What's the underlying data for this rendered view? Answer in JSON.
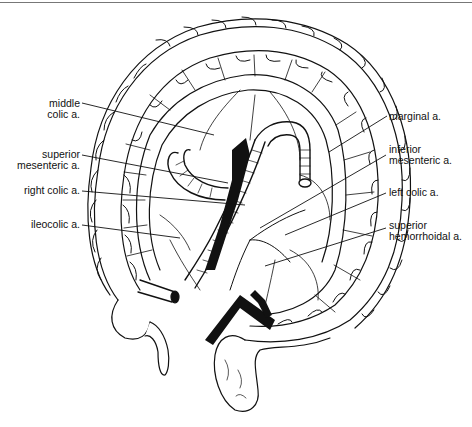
{
  "figure": {
    "labels_left": [
      {
        "id": "middle-colic",
        "lines": [
          "middle",
          "colic a."
        ],
        "x": 12,
        "y": 98,
        "leader": [
          82,
          103,
          214,
          135
        ]
      },
      {
        "id": "superior-mesenteric",
        "lines": [
          "superior",
          "mesenteric a."
        ],
        "x": 12,
        "y": 149,
        "leader": [
          82,
          155,
          228,
          183
        ]
      },
      {
        "id": "right-colic",
        "lines": [
          "right colic a."
        ],
        "x": 12,
        "y": 185,
        "leader": [
          82,
          191,
          245,
          205
        ]
      },
      {
        "id": "ileocolic",
        "lines": [
          "ileocolic a."
        ],
        "x": 12,
        "y": 219,
        "leader": [
          82,
          225,
          180,
          238
        ]
      }
    ],
    "labels_right": [
      {
        "id": "marginal",
        "lines": [
          "marginal a."
        ],
        "x": 389,
        "y": 111,
        "leader": [
          387,
          116,
          329,
          152
        ]
      },
      {
        "id": "inferior-mesenteric",
        "lines": [
          "inferior",
          "mesenteric a."
        ],
        "x": 389,
        "y": 144,
        "leader": [
          386,
          155,
          260,
          228
        ]
      },
      {
        "id": "left-colic",
        "lines": [
          "left colic a."
        ],
        "x": 389,
        "y": 187,
        "leader": [
          386,
          193,
          285,
          235
        ]
      },
      {
        "id": "superior-hemorrhoidal",
        "lines": [
          "superior",
          "hemorrhoidal a."
        ],
        "x": 389,
        "y": 220,
        "leader": [
          386,
          228,
          265,
          266
        ]
      }
    ],
    "colors": {
      "ink": "#111111",
      "background": "#ffffff",
      "rule": "#777777"
    }
  }
}
